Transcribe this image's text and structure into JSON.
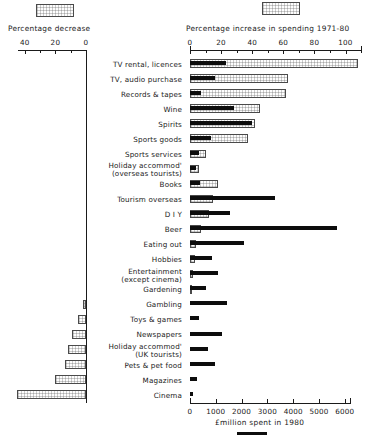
{
  "chart_data": {
    "type": "bar",
    "title": "",
    "orientation": "horizontal",
    "axes": {
      "decrease": {
        "label": "Percentage decrease",
        "ticks": [
          "40",
          "20",
          "0"
        ],
        "range": [
          50,
          0
        ],
        "minor_ticks": true,
        "position": "top-left",
        "direction": "right-to-left"
      },
      "increase": {
        "label": "Percentage increase in spending 1971-80",
        "ticks": [
          "0",
          "20",
          "40",
          "60",
          "80",
          "100"
        ],
        "range": [
          0,
          110
        ],
        "minor_ticks": true,
        "position": "top-right",
        "direction": "left-to-right"
      },
      "spend": {
        "label": "£million spent in 1980",
        "ticks": [
          "0",
          "1000",
          "2000",
          "3000",
          "4000",
          "5000",
          "6000"
        ],
        "range": [
          0,
          6200
        ],
        "position": "bottom",
        "direction": "left-to-right"
      }
    },
    "legend": [
      {
        "name": "percentage-change",
        "label": "",
        "style": "hatched-outline"
      },
      {
        "name": "spend-1980",
        "label": "",
        "style": "solid-black"
      }
    ],
    "categories": [
      "TV rental, licences",
      "TV, audio  purchase",
      "Records & tapes",
      "Wine",
      "Spirits",
      "Sports goods",
      "Sports services",
      "Holiday  accommod'|(overseas tourists)",
      "Books",
      "Tourism overseas",
      "D I Y",
      "Beer",
      "Eating out",
      "Hobbies",
      "Entertainment|(except cinema)",
      "Gardening",
      "Gambling",
      "Toys & games",
      "Newspapers",
      "Holiday  accommod'|(UK tourists)",
      "Pets & pet food",
      "Magazines",
      "Cinema"
    ],
    "series": [
      {
        "name": "Percentage increase 1971-80",
        "unit": "%",
        "values": [
          108,
          63,
          62,
          45,
          42,
          37,
          10,
          6,
          18,
          15,
          12,
          7,
          4,
          3,
          2,
          1,
          null,
          null,
          null,
          null,
          null,
          null,
          null
        ]
      },
      {
        "name": "Percentage decrease 1971-80",
        "unit": "%",
        "values": [
          null,
          null,
          null,
          null,
          null,
          null,
          null,
          null,
          null,
          null,
          null,
          null,
          null,
          null,
          null,
          null,
          2,
          5,
          9,
          12,
          14,
          20,
          45
        ]
      },
      {
        "name": "£million spent in 1980",
        "unit": "£m",
        "values": [
          1400,
          980,
          430,
          1700,
          2400,
          810,
          330,
          250,
          380,
          3300,
          1550,
          5700,
          2100,
          870,
          1100,
          620,
          1450,
          330,
          1250,
          700,
          980,
          260,
          105
        ]
      }
    ]
  },
  "labels": {
    "decrease_axis_title": "Percentage decrease",
    "increase_axis_title": "Percentage increase in spending 1971-80",
    "spend_axis_title": "£million spent in 1980",
    "dec_ticks": [
      "40",
      "20",
      "0"
    ],
    "inc_ticks": [
      "0",
      "20",
      "40",
      "60",
      "80",
      "100"
    ],
    "spend_ticks": [
      "0",
      "1000",
      "2000",
      "3000",
      "4000",
      "5000",
      "6000"
    ],
    "categories": [
      {
        "main": "TV rental, licences",
        "sub": ""
      },
      {
        "main": "TV, audio  purchase",
        "sub": ""
      },
      {
        "main": "Records & tapes",
        "sub": ""
      },
      {
        "main": "Wine",
        "sub": ""
      },
      {
        "main": "Spirits",
        "sub": ""
      },
      {
        "main": "Sports goods",
        "sub": ""
      },
      {
        "main": "Sports services",
        "sub": ""
      },
      {
        "main": "Holiday  accommod'",
        "sub": "(overseas tourists)"
      },
      {
        "main": "Books",
        "sub": ""
      },
      {
        "main": "Tourism overseas",
        "sub": ""
      },
      {
        "main": "D I Y",
        "sub": ""
      },
      {
        "main": "Beer",
        "sub": ""
      },
      {
        "main": "Eating out",
        "sub": ""
      },
      {
        "main": "Hobbies",
        "sub": ""
      },
      {
        "main": "Entertainment",
        "sub": "(except cinema)"
      },
      {
        "main": "Gardening",
        "sub": ""
      },
      {
        "main": "Gambling",
        "sub": ""
      },
      {
        "main": "Toys & games",
        "sub": ""
      },
      {
        "main": "Newspapers",
        "sub": ""
      },
      {
        "main": "Holiday  accommod'",
        "sub": "(UK tourists)"
      },
      {
        "main": "Pets & pet food",
        "sub": ""
      },
      {
        "main": "Magazines",
        "sub": ""
      },
      {
        "main": "Cinema",
        "sub": ""
      }
    ]
  }
}
